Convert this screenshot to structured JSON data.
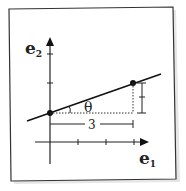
{
  "diagram": {
    "axes": {
      "x_label": "e",
      "x_sub": "1",
      "y_label": "e",
      "y_sub": "2"
    },
    "line": {
      "description": "line through (0,1) with slope 1/3",
      "start_point": [
        0,
        1
      ],
      "end_point": [
        3,
        2
      ]
    },
    "annotations": {
      "angle": "θ",
      "horizontal_run": "3",
      "vertical_rise": "1"
    },
    "colors": {
      "paper": "#ffffff",
      "ink": "#1a1a1a",
      "frame_shadow": "#999999"
    }
  }
}
